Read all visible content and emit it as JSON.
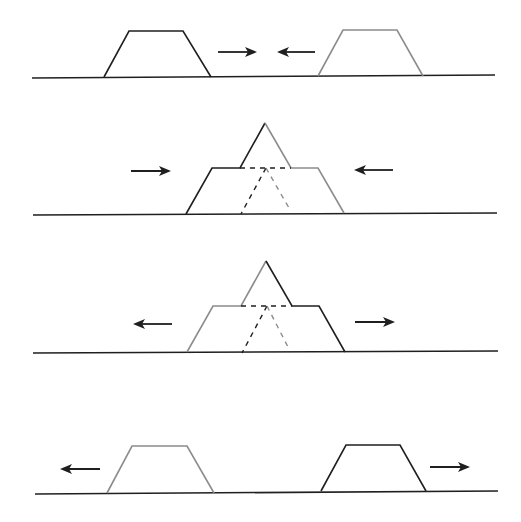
{
  "canvas": {
    "width": 521,
    "height": 522,
    "background": "#ffffff"
  },
  "colors": {
    "black": "#1f1f1f",
    "grey": "#8c8c8c"
  },
  "panels": [
    {
      "name": "panel-1-approach",
      "baseline": {
        "x1": 32,
        "y1": 78,
        "x2": 495,
        "y2": 75
      },
      "shapes": [
        {
          "name": "left-block",
          "color": "black",
          "points": [
            [
              104,
              77
            ],
            [
              129,
              31
            ],
            [
              183,
              31
            ],
            [
              211,
              77
            ]
          ]
        },
        {
          "name": "right-block",
          "color": "grey",
          "points": [
            [
              318,
              76
            ],
            [
              343,
              30
            ],
            [
              397,
              30
            ],
            [
              423,
              76
            ]
          ]
        }
      ],
      "dashes": [],
      "arrows": [
        {
          "name": "arrow-right",
          "x1": 218,
          "x2": 257,
          "y": 52,
          "dir": "right"
        },
        {
          "name": "arrow-left",
          "x1": 315,
          "x2": 277,
          "y": 52,
          "dir": "left"
        }
      ]
    },
    {
      "name": "panel-2-collision",
      "baseline": {
        "x1": 33,
        "y1": 215,
        "x2": 497,
        "y2": 213
      },
      "shapes": [
        {
          "name": "left-block-solid",
          "color": "black",
          "points": [
            [
              186,
              214
            ],
            [
              212,
              168
            ],
            [
              240,
              168
            ],
            [
              265,
              123
            ]
          ]
        },
        {
          "name": "right-block-solid",
          "color": "grey",
          "points": [
            [
              265,
              123
            ],
            [
              291,
              168
            ],
            [
              318,
              168
            ],
            [
              344,
              213
            ]
          ]
        }
      ],
      "dashes": [
        {
          "name": "overlap-top-dash",
          "color": "black",
          "x1": 240,
          "y1": 168,
          "x2": 291,
          "y2": 168
        },
        {
          "name": "left-block-hidden-edge",
          "color": "black",
          "x1": 266,
          "y1": 168,
          "x2": 241,
          "y2": 214
        },
        {
          "name": "right-block-hidden-edge",
          "color": "grey",
          "x1": 266,
          "y1": 168,
          "x2": 289,
          "y2": 208
        }
      ],
      "arrows": [
        {
          "name": "arrow-right",
          "x1": 131,
          "x2": 171,
          "y": 171,
          "dir": "right"
        },
        {
          "name": "arrow-left",
          "x1": 393,
          "x2": 354,
          "y": 170,
          "dir": "left"
        }
      ]
    },
    {
      "name": "panel-3-separation",
      "baseline": {
        "x1": 33,
        "y1": 353,
        "x2": 498,
        "y2": 351
      },
      "shapes": [
        {
          "name": "left-block-solid",
          "color": "grey",
          "points": [
            [
              187,
              352
            ],
            [
              213,
              306
            ],
            [
              241,
              306
            ],
            [
              266,
              261
            ]
          ]
        },
        {
          "name": "right-block-solid",
          "color": "black",
          "points": [
            [
              266,
              261
            ],
            [
              292,
              306
            ],
            [
              319,
              306
            ],
            [
              345,
              352
            ]
          ]
        }
      ],
      "dashes": [
        {
          "name": "overlap-top-dash",
          "color": "black",
          "x1": 241,
          "y1": 306,
          "x2": 292,
          "y2": 306
        },
        {
          "name": "left-block-hidden-edge",
          "color": "black",
          "x1": 267,
          "y1": 306,
          "x2": 242,
          "y2": 353
        },
        {
          "name": "right-block-hidden-edge",
          "color": "grey",
          "x1": 267,
          "y1": 306,
          "x2": 288,
          "y2": 347
        }
      ],
      "arrows": [
        {
          "name": "arrow-left",
          "x1": 172,
          "x2": 133,
          "y": 324,
          "dir": "left"
        },
        {
          "name": "arrow-right",
          "x1": 355,
          "x2": 395,
          "y": 322,
          "dir": "right"
        }
      ]
    },
    {
      "name": "panel-4-departure",
      "baseline": {
        "x1": 35,
        "y1": 494,
        "x2": 498,
        "y2": 491
      },
      "shapes": [
        {
          "name": "left-block",
          "color": "grey",
          "points": [
            [
              107,
              493
            ],
            [
              132,
              446
            ],
            [
              187,
              446
            ],
            [
              214,
              493
            ]
          ]
        },
        {
          "name": "right-block",
          "color": "black",
          "points": [
            [
              321,
              491
            ],
            [
              346,
              445
            ],
            [
              400,
              445
            ],
            [
              426,
              491
            ]
          ]
        }
      ],
      "dashes": [],
      "arrows": [
        {
          "name": "arrow-left",
          "x1": 100,
          "x2": 60,
          "y": 469,
          "dir": "left"
        },
        {
          "name": "arrow-right",
          "x1": 430,
          "x2": 470,
          "y": 467,
          "dir": "right"
        }
      ]
    }
  ]
}
